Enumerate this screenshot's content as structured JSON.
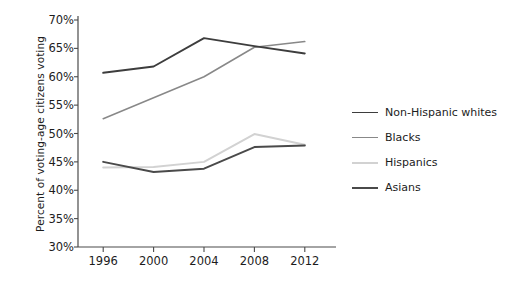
{
  "chart_data": {
    "type": "line",
    "title": "",
    "xlabel": "",
    "ylabel": "Percent of voting-age citizens voting",
    "x": [
      1996,
      2000,
      2004,
      2008,
      2012
    ],
    "categories": [
      "1996",
      "2000",
      "2004",
      "2008",
      "2012"
    ],
    "xlim": [
      1994,
      2014
    ],
    "ylim": [
      30,
      70
    ],
    "ytick_values": [
      30,
      35,
      40,
      45,
      50,
      55,
      60,
      65,
      70
    ],
    "ytick_labels": [
      "30%",
      "35%",
      "40%",
      "45%",
      "50%",
      "55%",
      "60%",
      "65%",
      "70%"
    ],
    "xtick_labels": [
      "1996",
      "2000",
      "2004",
      "2008",
      "2012"
    ],
    "grid": false,
    "legend_position": "right",
    "series": [
      {
        "name": "Non-Hispanic whites",
        "color": "#3d3d3d",
        "width": 1.9,
        "values": [
          60.7,
          61.8,
          66.8,
          65.4,
          64.1
        ]
      },
      {
        "name": "Blacks",
        "color": "#888888",
        "width": 1.5,
        "values": [
          52.6,
          56.3,
          60.0,
          65.2,
          66.2
        ]
      },
      {
        "name": "Hispanics",
        "color": "#d2d2d2",
        "width": 2.0,
        "values": [
          44.0,
          44.1,
          45.0,
          49.9,
          48.0
        ]
      },
      {
        "name": "Asians",
        "color": "#4a4a4a",
        "width": 2.0,
        "values": [
          45.0,
          43.2,
          43.8,
          47.6,
          47.9
        ]
      }
    ]
  },
  "legend": {
    "items": [
      {
        "label": "Non-Hispanic whites"
      },
      {
        "label": "Blacks"
      },
      {
        "label": "Hispanics"
      },
      {
        "label": "Asians"
      }
    ]
  },
  "axis": {
    "spine_color": "#4a4a4a",
    "tick_color": "#4a4a4a"
  }
}
